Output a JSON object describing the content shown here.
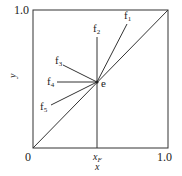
{
  "diagram": {
    "type": "x-y phase equilibrium diagram (feed lines)",
    "axes": {
      "xlabel": "x",
      "ylabel": "y",
      "x_ticks": [
        "0",
        "x_F",
        "1.0"
      ],
      "y_ticks": [
        "1.0"
      ],
      "origin_label": "0",
      "x_max_label": "1.0",
      "y_max_label": "1.0",
      "xf_label": "x",
      "xf_sub": "F"
    },
    "point": {
      "label": "e"
    },
    "lines": [
      {
        "label": "f",
        "sub": "1"
      },
      {
        "label": "f",
        "sub": "2"
      },
      {
        "label": "f",
        "sub": "3"
      },
      {
        "label": "f",
        "sub": "4"
      },
      {
        "label": "f",
        "sub": "5"
      }
    ],
    "colors": {
      "stroke": "#222222",
      "background": "#ffffff"
    }
  }
}
